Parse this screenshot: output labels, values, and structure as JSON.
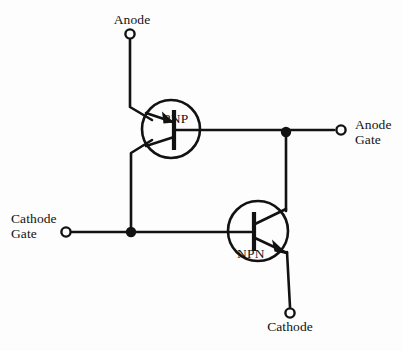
{
  "diagram": {
    "background_color": "#fdfdfd",
    "line_color": "#121212"
  },
  "terminals": [
    {
      "id": "anode",
      "label": "Anode",
      "x": 130,
      "y": 33,
      "label_position": "above"
    },
    {
      "id": "anode-gate",
      "label": "Anode\nGate",
      "x": 341,
      "y": 134,
      "label_position": "right"
    },
    {
      "id": "cathode-gate",
      "label": "Cathode\nGate",
      "x": 65,
      "y": 232,
      "label_position": "left"
    },
    {
      "id": "cathode",
      "label": "Cathode",
      "x": 290,
      "y": 314,
      "label_position": "below"
    }
  ],
  "devices": [
    {
      "id": "pnp-transistor",
      "label": "PNP",
      "type": "bipolar-junction-transistor",
      "polarity": "PNP",
      "center_x": 171,
      "center_y": 129,
      "radius": 29,
      "emitter": "anode",
      "base": "anode-gate",
      "collector": "cathode-gate"
    },
    {
      "id": "npn-transistor",
      "label": "NPN",
      "type": "bipolar-junction-transistor",
      "polarity": "NPN",
      "center_x": 258,
      "center_y": 231,
      "radius": 30,
      "emitter": "cathode",
      "base": "cathode-gate",
      "collector": "anode-gate"
    }
  ],
  "junctions": [
    {
      "id": "junction-cathode-gate-node",
      "x": 131,
      "y": 232
    },
    {
      "id": "junction-anode-gate-node",
      "x": 286,
      "y": 134
    }
  ]
}
